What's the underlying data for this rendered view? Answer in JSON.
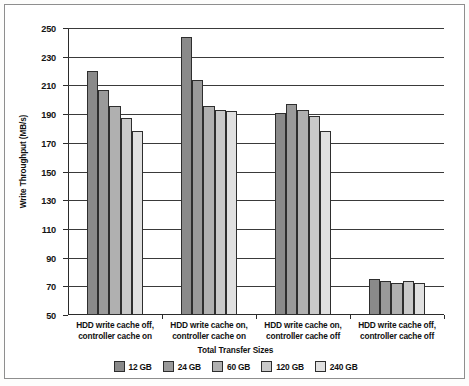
{
  "chart_data": {
    "type": "bar",
    "title": "",
    "xlabel": "Total Transfer Sizes",
    "ylabel": "Write Throughput (MB/s)",
    "ylim": [
      50,
      250
    ],
    "ytick_step": 20,
    "yticks": [
      250,
      230,
      210,
      190,
      170,
      150,
      130,
      110,
      90,
      70,
      50
    ],
    "grid": true,
    "legend_position": "bottom",
    "categories": [
      "HDD write cache off,\ncontroller cache on",
      "HDD write cache on,\ncontroller cache on",
      "HDD write cache on,\ncontroller cache off",
      "HDD write cache off,\ncontroller cache off"
    ],
    "category_lines": [
      [
        "HDD write cache off,",
        "controller cache on"
      ],
      [
        "HDD write cache on,",
        "controller cache on"
      ],
      [
        "HDD write cache on,",
        "controller cache off"
      ],
      [
        "HDD write cache off,",
        "controller cache off"
      ]
    ],
    "series": [
      {
        "name": "12 GB",
        "color": "#8a8a8a",
        "values": [
          220,
          244,
          191,
          75
        ]
      },
      {
        "name": "24 GB",
        "color": "#9a9a9a",
        "values": [
          207,
          214,
          197,
          74
        ]
      },
      {
        "name": "60 GB",
        "color": "#b0b0b0",
        "values": [
          196,
          196,
          193,
          72
        ]
      },
      {
        "name": "120 GB",
        "color": "#c9c9c9",
        "values": [
          187,
          193,
          189,
          74
        ]
      },
      {
        "name": "240 GB",
        "color": "#e0e0e0",
        "values": [
          178,
          192,
          178,
          72
        ]
      }
    ]
  }
}
